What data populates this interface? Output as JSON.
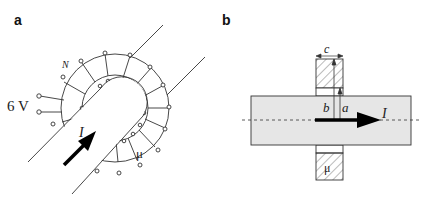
{
  "figure": {
    "panels": [
      {
        "id": "a",
        "label": "a",
        "description": "Toroidal coil with N turns and permeability mu wound around a straight conductor carrying current I, driven by 6 V",
        "annotations": {
          "turns": "N",
          "voltage": "6 V",
          "current": "I",
          "permeability": "μ"
        }
      },
      {
        "id": "b",
        "label": "b",
        "description": "Cross-section: conductor carrying current I along axis passing through toroid of rectangular cross-section with inner radius a, outer radius b, thickness c",
        "annotations": {
          "thickness": "c",
          "outer_radius": "b",
          "inner_radius": "a",
          "current": "I",
          "permeability": "μ"
        }
      }
    ],
    "colors": {
      "line": "#333333",
      "conductor_fill": "#e6e6e6",
      "arrow": "#000000",
      "background": "#ffffff"
    }
  }
}
